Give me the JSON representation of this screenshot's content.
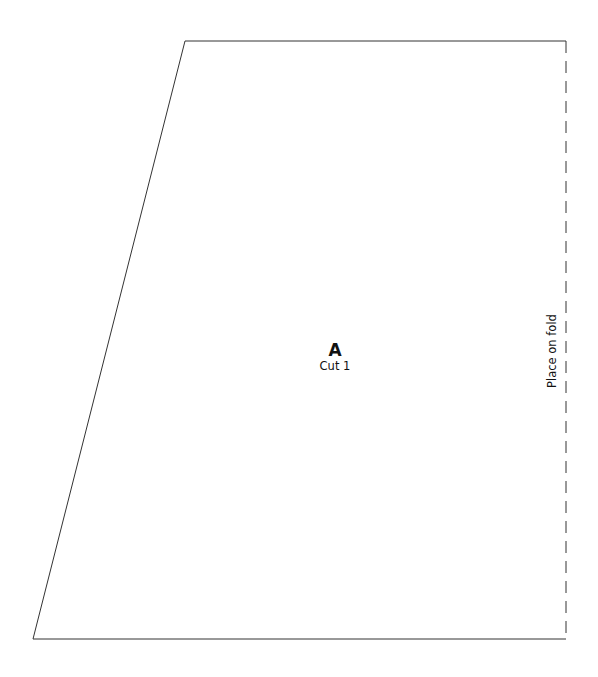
{
  "pattern_piece": {
    "letter": "A",
    "instruction": "Cut 1",
    "fold_label": "Place on fold",
    "outline": {
      "top_left": [
        185,
        41
      ],
      "top_right": [
        566,
        41
      ],
      "bottom_right": [
        566,
        639
      ],
      "bottom_left": [
        33,
        639
      ]
    },
    "colors": {
      "outline": "#333333",
      "text": "#111111",
      "background": "#ffffff"
    }
  }
}
